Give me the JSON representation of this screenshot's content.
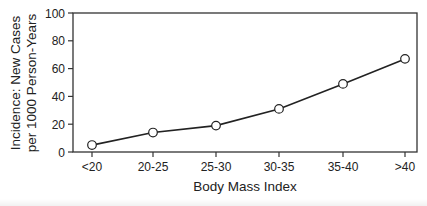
{
  "chart_data": {
    "type": "line",
    "title": "",
    "xlabel": "Body Mass Index",
    "ylabel": [
      "Incidence: New Cases",
      "per 1000 Person-Years"
    ],
    "categories": [
      "<20",
      "20-25",
      "25-30",
      "30-35",
      "35-40",
      ">40"
    ],
    "series": [
      {
        "name": "Incidence",
        "values": [
          5,
          14,
          19,
          31,
          49,
          67
        ],
        "marker": "open-circle"
      }
    ],
    "ylim": [
      0,
      100
    ],
    "yticks": [
      0,
      20,
      40,
      60,
      80,
      100
    ],
    "grid": false,
    "legend": null,
    "frame": "box"
  },
  "colors": {
    "line": "#222222",
    "marker_fill": "#ffffff",
    "axis": "#333333",
    "background": "#ffffff"
  }
}
